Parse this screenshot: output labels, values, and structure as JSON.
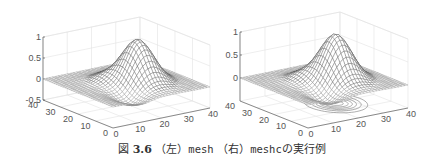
{
  "caption": {
    "figure_label": "図",
    "figure_number": "3.6",
    "left_marker": "（左）",
    "left_command": "mesh",
    "right_marker": "（右）",
    "right_command": "meshc",
    "suffix": "の実行例"
  },
  "chart_data": [
    {
      "type": "surface-mesh",
      "title": "mesh",
      "position": "left",
      "xlabel": "",
      "ylabel": "",
      "zlabel": "",
      "x_ticks": [
        "0",
        "10",
        "20",
        "30",
        "40"
      ],
      "y_ticks": [
        "0",
        "10",
        "20",
        "30",
        "40"
      ],
      "z_ticks": [
        "-0.5",
        "0",
        "0.5",
        "1"
      ],
      "xlim": [
        0,
        40
      ],
      "ylim": [
        0,
        40
      ],
      "zlim": [
        -0.5,
        1
      ],
      "grid": true,
      "contour_below": false,
      "surface": "Gaussian-like peak ~1 near x≈22,y≈20 with flat plateau ~0 at low x and a slight dip around -0.2"
    },
    {
      "type": "surface-mesh-contour",
      "title": "meshc",
      "position": "right",
      "xlabel": "",
      "ylabel": "",
      "zlabel": "",
      "x_ticks": [
        "0",
        "10",
        "20",
        "30",
        "40"
      ],
      "y_ticks": [
        "0",
        "10",
        "20",
        "30",
        "40"
      ],
      "z_ticks": [
        "0",
        "0.5",
        "1"
      ],
      "xlim": [
        0,
        40
      ],
      "ylim": [
        0,
        40
      ],
      "zlim": [
        -0.5,
        1
      ],
      "grid": true,
      "contour_below": true,
      "surface": "Same surface as left with contour lines projected on the base plane"
    }
  ]
}
